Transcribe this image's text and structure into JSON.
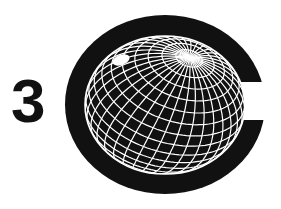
{
  "logo": {
    "numeral": "3",
    "mark": "C-shaped disc enclosing a wireframe globe",
    "icon": "globe-icon"
  },
  "colors": {
    "background": "#ffffff",
    "ink": "#111111",
    "grid": "#ffffff"
  }
}
